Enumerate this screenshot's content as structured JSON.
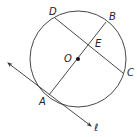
{
  "diagram": {
    "type": "circle-geometry",
    "colors": {
      "stroke": "#333333",
      "text": "#222222",
      "background": "#ffffff"
    },
    "circle": {
      "center_label": "O",
      "cx": 78,
      "cy": 59,
      "r": 48
    },
    "points": {
      "D": {
        "label": "D",
        "x": 55,
        "y": 18,
        "lx": 49,
        "ly": 15
      },
      "B": {
        "label": "B",
        "x": 106,
        "y": 22,
        "lx": 109,
        "ly": 20
      },
      "E": {
        "label": "E",
        "x": 91,
        "y": 41,
        "lx": 95,
        "ly": 47
      },
      "O": {
        "label": "O",
        "x": 78,
        "y": 59,
        "lx": 64,
        "ly": 62
      },
      "C": {
        "label": "C",
        "x": 123,
        "y": 73,
        "lx": 127,
        "ly": 76
      },
      "A": {
        "label": "A",
        "x": 49,
        "y": 95,
        "lx": 39,
        "ly": 105
      }
    },
    "segments": [
      {
        "name": "chord-DC",
        "from": "D",
        "to": "C"
      },
      {
        "name": "diameter-AB",
        "from": "A",
        "to": "B"
      }
    ],
    "tangent_line": {
      "label": "ℓ",
      "x1": 8,
      "y1": 63,
      "x2": 91,
      "y2": 126,
      "lx": 94,
      "ly": 131,
      "through": "A"
    }
  }
}
